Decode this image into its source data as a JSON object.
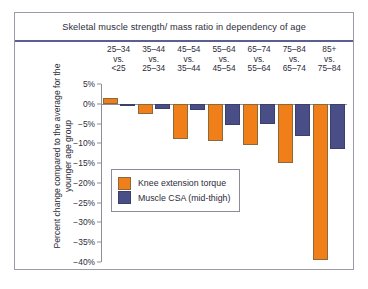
{
  "chart_data": {
    "type": "bar",
    "title": "Skeletal muscle strength/ mass ratio in dependency of age",
    "xlabel": "",
    "ylabel": "Percent change compared to the average for the younger age group",
    "ylim": [
      -40,
      5
    ],
    "ytick_values": [
      5,
      0,
      -5,
      -10,
      -15,
      -20,
      -25,
      -30,
      -35,
      -40
    ],
    "ytick_labels": [
      "5%",
      "0%",
      "−5%",
      "−10%",
      "−15%",
      "−20%",
      "−25%",
      "−30%",
      "−35%",
      "−40%"
    ],
    "grid": false,
    "legend_position": "inside-left-middle",
    "categories": [
      {
        "line1": "25–34",
        "line2": "vs.",
        "line3": "<25"
      },
      {
        "line1": "35–44",
        "line2": "vs.",
        "line3": "25–34"
      },
      {
        "line1": "45–54",
        "line2": "vs.",
        "line3": "35–44"
      },
      {
        "line1": "55–64",
        "line2": "vs.",
        "line3": "45–54"
      },
      {
        "line1": "65–74",
        "line2": "vs.",
        "line3": "55–64"
      },
      {
        "line1": "75–84",
        "line2": "vs.",
        "line3": "65–74"
      },
      {
        "line1": "85+",
        "line2": "vs.",
        "line3": "75–84"
      }
    ],
    "series": [
      {
        "name": "Knee extension torque",
        "color": "#f07f1a",
        "values": [
          1.5,
          -2.5,
          -9.0,
          -9.5,
          -10.5,
          -15.0,
          -39.5
        ]
      },
      {
        "name": "Muscle CSA (mid-thigh)",
        "color": "#4a4e86",
        "values": [
          -0.3,
          -1.3,
          -1.7,
          -5.3,
          -5.2,
          -8.2,
          -11.5
        ]
      }
    ]
  },
  "legend": {
    "items": [
      {
        "label": "Knee extension torque",
        "color": "#f07f1a"
      },
      {
        "label": "Muscle CSA (mid-thigh)",
        "color": "#4a4e86"
      }
    ]
  }
}
